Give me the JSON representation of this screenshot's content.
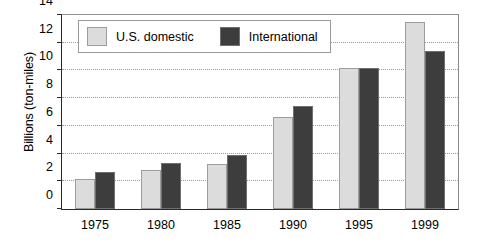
{
  "chart_data": {
    "type": "bar",
    "title": "",
    "xlabel": "",
    "ylabel": "Billions (ton-miles)",
    "categories": [
      "1975",
      "1980",
      "1985",
      "1990",
      "1995",
      "1999"
    ],
    "series": [
      {
        "name": "U.S. domestic",
        "color": "#dcdcdc",
        "values": [
          2.2,
          2.8,
          3.25,
          6.65,
          10.2,
          13.5
        ]
      },
      {
        "name": "International",
        "color": "#3d3d3d",
        "values": [
          2.65,
          3.35,
          3.9,
          7.4,
          10.15,
          11.4
        ]
      }
    ],
    "ylim": [
      0,
      14
    ],
    "yticks": [
      0,
      2,
      4,
      6,
      8,
      10,
      12,
      14
    ],
    "ytick_labels": [
      "0",
      "2",
      "4",
      "6",
      "8",
      "10",
      "12",
      "14"
    ],
    "grid": true,
    "grid_axis": "y",
    "legend_position": "upper left"
  }
}
